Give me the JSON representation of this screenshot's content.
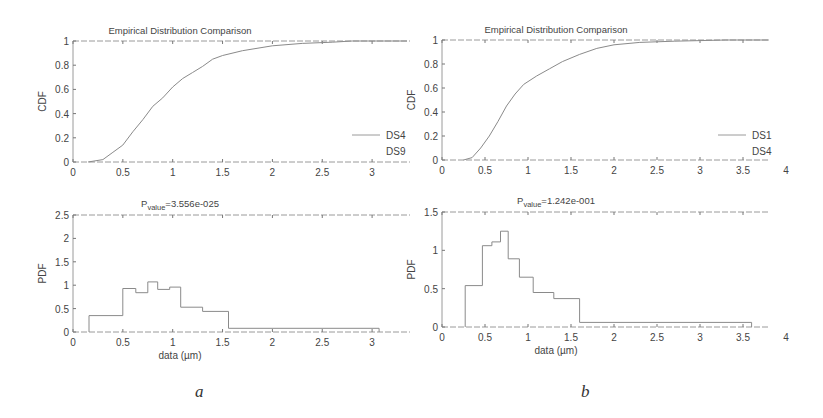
{
  "panels": [
    {
      "label": "a"
    },
    {
      "label": "b"
    }
  ],
  "chart_data": [
    {
      "id": "a-cdf",
      "type": "line",
      "title": "Empirical Distribution Comparison",
      "xlabel": "",
      "ylabel": "CDF",
      "xlim": [
        0,
        3.35
      ],
      "ylim": [
        0,
        1
      ],
      "xticks": [
        0,
        0.5,
        1,
        1.5,
        2,
        2.5,
        3
      ],
      "yticks": [
        0,
        0.2,
        0.4,
        0.6,
        0.8,
        1
      ],
      "ytick_labels": [
        "0",
        "0.2",
        "0.4",
        "0.6",
        "0.8",
        "1"
      ],
      "legend": [
        "DS4",
        "DS9"
      ],
      "legend_position": "lower right",
      "series": [
        {
          "name": "DS4",
          "x": [
            0.15,
            0.3,
            0.4,
            0.5,
            0.6,
            0.7,
            0.8,
            0.9,
            1.0,
            1.1,
            1.2,
            1.3,
            1.4,
            1.5,
            1.7,
            2.0,
            2.3,
            2.6,
            2.8,
            3.35
          ],
          "y": [
            0.0,
            0.02,
            0.08,
            0.14,
            0.25,
            0.35,
            0.46,
            0.53,
            0.62,
            0.69,
            0.74,
            0.79,
            0.85,
            0.88,
            0.92,
            0.96,
            0.98,
            0.99,
            1.0,
            1.0
          ]
        }
      ]
    },
    {
      "id": "a-pdf",
      "type": "bar",
      "title": "P_value=3.556e-025",
      "title_main": "P",
      "title_sub": "value",
      "title_rest": "=3.556e-025",
      "xlabel": "data (µm)",
      "ylabel": "PDF",
      "xlim": [
        0,
        3.35
      ],
      "ylim": [
        0,
        2.5
      ],
      "xticks": [
        0,
        0.5,
        1,
        1.5,
        2,
        2.5,
        3
      ],
      "yticks": [
        0,
        0.5,
        1,
        1.5,
        2,
        2.5
      ],
      "ytick_labels": [
        "0",
        "0.5",
        "1",
        "1.5",
        "2",
        "2.5"
      ],
      "bin_edges": [
        0.16,
        0.5,
        0.63,
        0.75,
        0.85,
        0.97,
        1.08,
        1.3,
        1.56,
        3.07
      ],
      "values": [
        0.35,
        0.93,
        0.84,
        1.07,
        0.91,
        0.96,
        0.53,
        0.44,
        0.08
      ]
    },
    {
      "id": "b-cdf",
      "type": "line",
      "title": "Empirical Distribution Comparison",
      "xlabel": "",
      "ylabel": "CDF",
      "xlim": [
        0,
        3.8
      ],
      "ylim": [
        0,
        1
      ],
      "xticks": [
        0,
        0.5,
        1,
        1.5,
        2,
        2.5,
        3,
        3.5,
        4
      ],
      "yticks": [
        0,
        0.2,
        0.4,
        0.6,
        0.8,
        1
      ],
      "ytick_labels": [
        "0",
        "0.2",
        "0.4",
        "0.6",
        "0.8",
        "1"
      ],
      "legend": [
        "DS1",
        "DS4"
      ],
      "legend_position": "lower right",
      "series": [
        {
          "name": "DS1",
          "x": [
            0.25,
            0.35,
            0.45,
            0.55,
            0.65,
            0.75,
            0.85,
            0.95,
            1.1,
            1.25,
            1.4,
            1.6,
            1.8,
            2.0,
            2.3,
            2.7,
            3.0,
            3.3,
            3.8
          ],
          "y": [
            0.0,
            0.02,
            0.1,
            0.2,
            0.32,
            0.45,
            0.55,
            0.63,
            0.7,
            0.76,
            0.82,
            0.88,
            0.93,
            0.96,
            0.98,
            0.99,
            0.995,
            1.0,
            1.0
          ]
        }
      ]
    },
    {
      "id": "b-pdf",
      "type": "bar",
      "title": "P_value=1.242e-001",
      "title_main": "P",
      "title_sub": "value",
      "title_rest": "=1.242e-001",
      "xlabel": "data (µm)",
      "ylabel": "PDF",
      "xlim": [
        0,
        3.8
      ],
      "ylim": [
        0,
        1.5
      ],
      "xticks": [
        0,
        0.5,
        1,
        1.5,
        2,
        2.5,
        3,
        3.5,
        4
      ],
      "yticks": [
        0,
        0.5,
        1,
        1.5
      ],
      "ytick_labels": [
        "0",
        "0.5",
        "1",
        "1.5"
      ],
      "bin_edges": [
        0.27,
        0.47,
        0.58,
        0.68,
        0.77,
        0.9,
        1.06,
        1.3,
        1.6,
        3.6
      ],
      "values": [
        0.54,
        1.06,
        1.11,
        1.25,
        0.89,
        0.65,
        0.45,
        0.37,
        0.06
      ]
    }
  ],
  "layout": {
    "axes": [
      {
        "chart": 0,
        "x0": 73,
        "x1": 410,
        "y0": 162,
        "y1": 41,
        "px_per_unit": 99.7
      },
      {
        "chart": 1,
        "x0": 73,
        "x1": 410,
        "y0": 332,
        "y1": 215,
        "px_per_unit": 99.7
      },
      {
        "chart": 2,
        "x0": 442,
        "x1": 770,
        "y0": 160,
        "y1": 40,
        "px_per_unit": 86
      },
      {
        "chart": 3,
        "x0": 442,
        "x1": 770,
        "y0": 327,
        "y1": 212,
        "px_per_unit": 86
      }
    ]
  }
}
